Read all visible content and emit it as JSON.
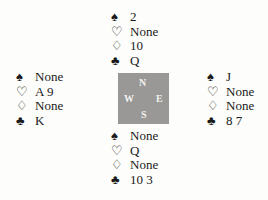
{
  "hands": {
    "north": {
      "spades": "2",
      "hearts": "None",
      "diamonds": "10",
      "clubs": "Q"
    },
    "west": {
      "spades": "None",
      "hearts": "A 9",
      "diamonds": "None",
      "clubs": "K"
    },
    "east": {
      "spades": "J",
      "hearts": "None",
      "diamonds": "None",
      "clubs": "8 7"
    },
    "south": {
      "spades": "None",
      "hearts": "Q",
      "diamonds": "None",
      "clubs": "10 3"
    }
  },
  "suits": {
    "spades": "♠",
    "hearts": "♡",
    "diamonds": "♢",
    "clubs": "♣"
  },
  "compass": {
    "n": "N",
    "s": "S",
    "e": "E",
    "w": "W",
    "color": "#999896"
  }
}
